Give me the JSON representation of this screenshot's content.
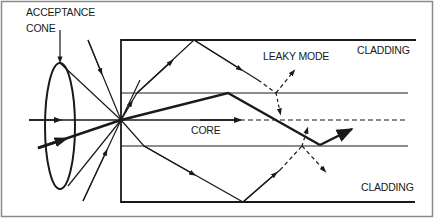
{
  "diagram": {
    "labels": {
      "acceptance_line1": "ACCEPTANCE",
      "acceptance_line2": "CONE",
      "leaky_mode": "LEAKY MODE",
      "cladding_top": "CLADDING",
      "core": "CORE",
      "cladding_bottom": "CLADDING"
    },
    "colors": {
      "ink": "#1a1a1a",
      "background": "#ffffff",
      "frame": "#8a8a8a"
    },
    "elements": [
      "acceptance-cone-ellipse",
      "fiber-cladding-boundary",
      "core-boundaries",
      "axial-ray",
      "guided-ray",
      "leaky-mode-ray",
      "refracted-ray",
      "incident-rays"
    ]
  }
}
